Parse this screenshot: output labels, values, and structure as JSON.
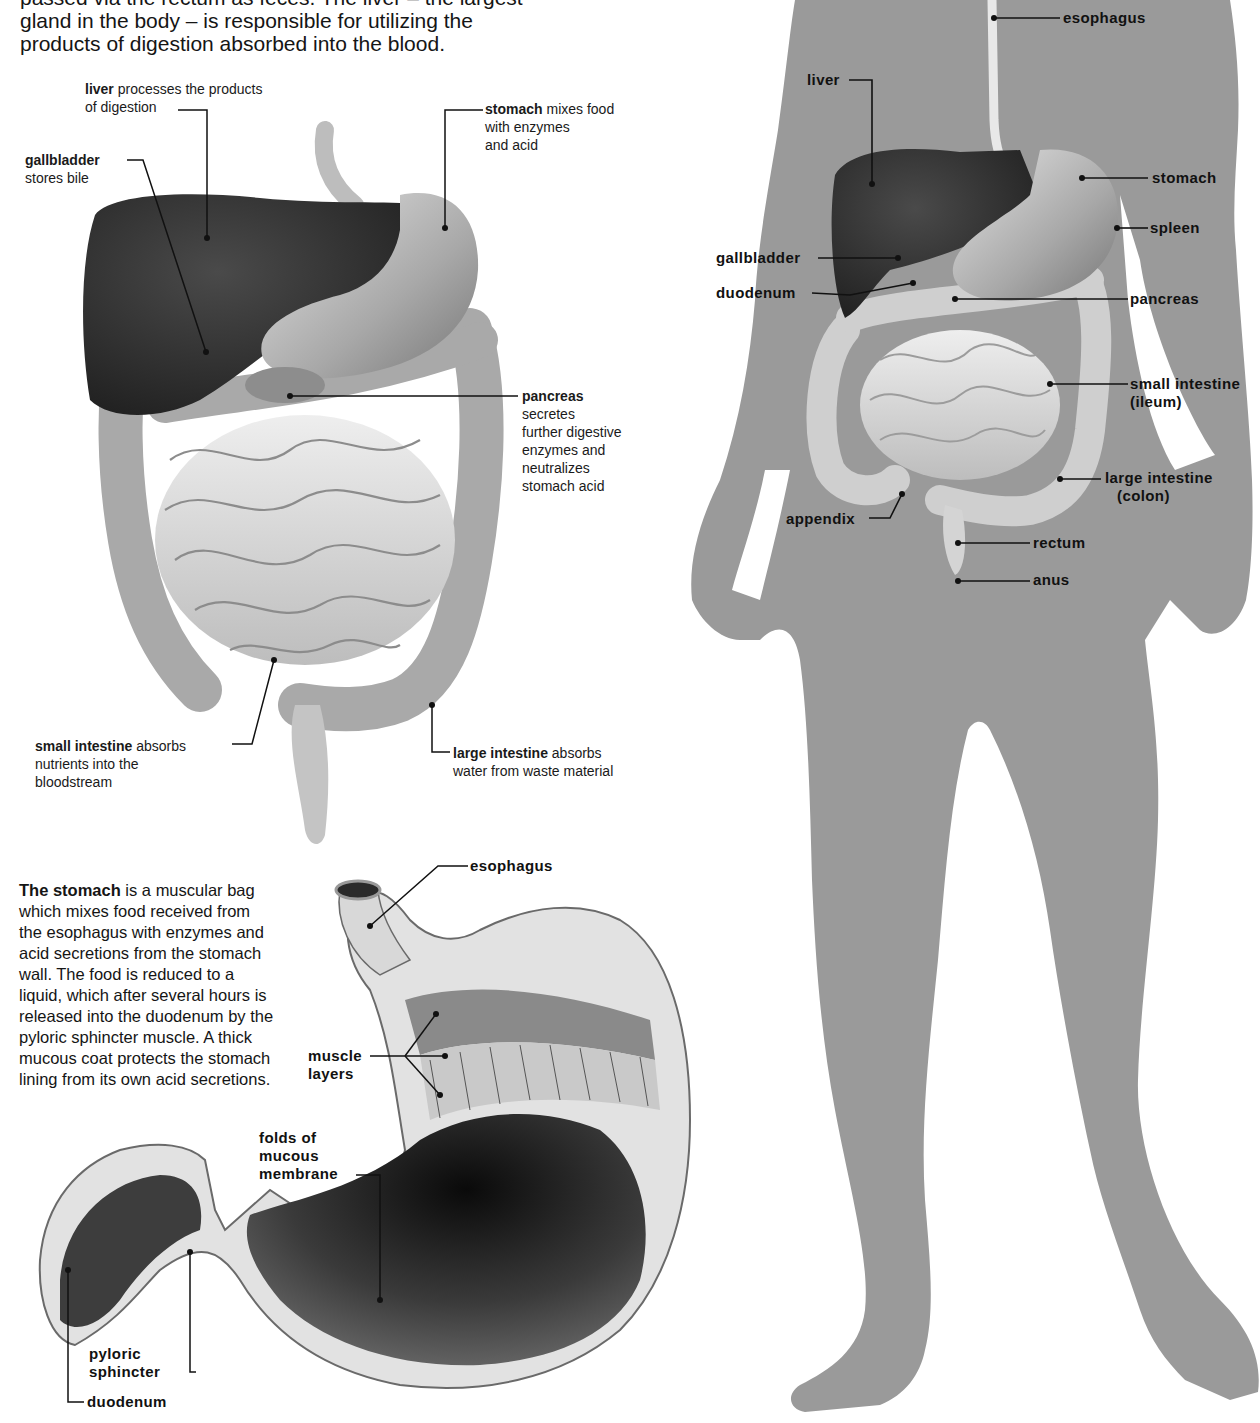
{
  "intro": {
    "line1": "passed via the rectum as feces. The liver – the largest",
    "line2": "gland in the body – is responsible for utilizing the",
    "line3": "products of digestion absorbed into the blood."
  },
  "organs_diagram": {
    "labels": [
      {
        "id": "liver",
        "term": "liver",
        "desc": "processes the products of digestion"
      },
      {
        "id": "gallbladder",
        "term": "gallbladder",
        "desc": "stores bile"
      },
      {
        "id": "stomach",
        "term": "stomach",
        "desc": "mixes food with enzymes and acid"
      },
      {
        "id": "pancreas",
        "term": "pancreas",
        "desc": "secretes further digestive enzymes and neutralizes stomach acid"
      },
      {
        "id": "small_intestine",
        "term": "small intestine",
        "desc": "absorbs nutrients into the bloodstream"
      },
      {
        "id": "large_intestine",
        "term": "large intestine",
        "desc": "absorbs water from waste material"
      }
    ],
    "liver": {
      "term": "liver",
      "desc1": "processes the products",
      "desc2": "of digestion"
    },
    "gallbladder": {
      "term": "gallbladder",
      "desc1": "stores bile"
    },
    "stomach": {
      "term": "stomach",
      "desc1": "mixes food",
      "desc2": "with enzymes",
      "desc3": "and acid"
    },
    "pancreas": {
      "term": "pancreas",
      "desc1": "secretes",
      "desc2": "further digestive",
      "desc3": "enzymes and",
      "desc4": "neutralizes",
      "desc5": "stomach acid"
    },
    "small_intestine": {
      "term": "small intestine",
      "desc1": "absorbs",
      "desc2": "nutrients into the",
      "desc3": "bloodstream"
    },
    "large_intestine": {
      "term": "large intestine",
      "desc1": "absorbs",
      "desc2": "water from waste material"
    }
  },
  "stomach_section": {
    "paragraph_bold": "The stomach",
    "paragraph_rest": " is a muscular bag which mixes food received from the esophagus with enzymes and acid secretions from the stomach wall. The food is reduced to a liquid, which after several hours is released into the duodenum by the pyloric sphincter muscle. A thick mucous coat protects the stomach lining from its own acid secretions.",
    "labels": {
      "esophagus": "esophagus",
      "muscle1": "muscle",
      "muscle2": "layers",
      "folds1": "folds of",
      "folds2": "mucous",
      "folds3": "membrane",
      "pyloric1": "pyloric",
      "pyloric2": "sphincter",
      "duodenum": "duodenum"
    }
  },
  "body_diagram": {
    "labels": {
      "esophagus": "esophagus",
      "liver": "liver",
      "stomach": "stomach",
      "spleen": "spleen",
      "gallbladder": "gallbladder",
      "duodenum": "duodenum",
      "pancreas": "pancreas",
      "small_intestine": "small intestine",
      "small_intestine_sub": "(ileum)",
      "large_intestine": "large intestine",
      "large_intestine_sub": "(colon)",
      "appendix": "appendix",
      "rectum": "rectum",
      "anus": "anus"
    }
  },
  "colors": {
    "silhouette": "#9a9a9a",
    "liver": "#3a3a3a",
    "organ_light": "#d6d6d6",
    "organ_mid": "#b0b0b0",
    "stomach_inner": "#2a2a2a",
    "text": "#111111"
  }
}
